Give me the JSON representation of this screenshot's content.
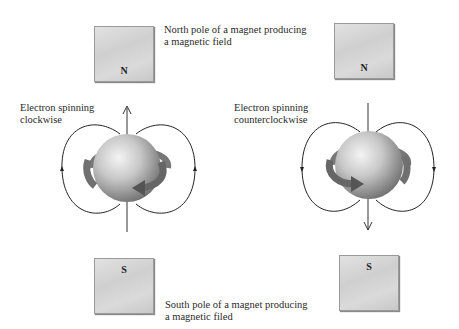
{
  "figure": {
    "top_caption": {
      "line1": "North pole of a magnet producing",
      "line2": "a magnetic field"
    },
    "bottom_caption": {
      "line1": "South pole of a magnet producing",
      "line2": "a magnetic filed"
    },
    "left_panel": {
      "label_line1": "Electron spinning",
      "label_line2": "clockwise",
      "top_magnet_pole": "N",
      "bottom_magnet_pole": "S",
      "field_arrow_direction": "up"
    },
    "right_panel": {
      "label_line1": "Electron spinning",
      "label_line2": "counterclockwise",
      "top_magnet_pole": "N",
      "bottom_magnet_pole": "S",
      "field_arrow_direction": "down"
    }
  }
}
